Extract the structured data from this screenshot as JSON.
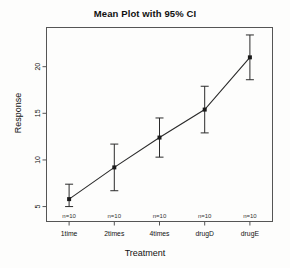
{
  "chart_data": {
    "type": "line",
    "title": "Mean Plot with 95% CI",
    "xlabel": "Treatment",
    "ylabel": "Response",
    "categories": [
      "1time",
      "2times",
      "4times",
      "drugD",
      "drugE"
    ],
    "values": [
      5.8,
      9.2,
      12.4,
      15.4,
      21.0
    ],
    "ci_lower": [
      5.0,
      6.7,
      10.3,
      12.9,
      18.6
    ],
    "ci_upper": [
      7.4,
      11.7,
      14.5,
      17.9,
      23.4
    ],
    "point_annotations": [
      "n=10",
      "n=10",
      "n=10",
      "n=10",
      "n=10"
    ],
    "yticks": [
      5,
      10,
      15,
      20
    ],
    "ytick_labels": [
      "5",
      "10",
      "15",
      "20"
    ],
    "ylim": [
      3.4,
      24.2
    ],
    "xlim": [
      0.5,
      5.5
    ],
    "grid": false,
    "legend": "none",
    "series": [
      {
        "name": "Mean Response",
        "values": [
          5.8,
          9.2,
          12.4,
          15.4,
          21.0
        ]
      }
    ],
    "marker": "filled-square",
    "line_color": "#2b2b2b",
    "marker_color": "#1a1a1a",
    "errorbar_color": "#2b2b2b",
    "frame_color": "#555555",
    "background": "#fdfdfc"
  }
}
